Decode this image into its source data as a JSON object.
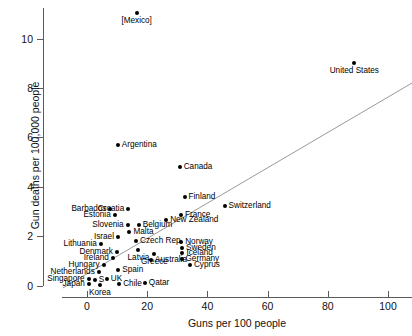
{
  "chart_data": {
    "type": "scatter",
    "title": "",
    "xlabel": "Guns per 100 people",
    "ylabel": "Gun deaths per 100,000 people",
    "xlim": [
      -12,
      108
    ],
    "ylim": [
      -0.55,
      11.6
    ],
    "xticks": [
      0,
      20,
      40,
      60,
      80,
      100
    ],
    "yticks": [
      0,
      2,
      4,
      6,
      8,
      10
    ],
    "grid": false,
    "legend": null,
    "trendline": {
      "x0": -8,
      "y0": -0.1,
      "x1": 108,
      "y1": 8.2,
      "color": "#999999"
    },
    "points": [
      {
        "label": "[Mexico]",
        "x": 16.5,
        "y": 11.05,
        "pos": "b"
      },
      {
        "label": "United States",
        "x": 88.8,
        "y": 9.0,
        "pos": "b"
      },
      {
        "label": "Argentina",
        "x": 10.2,
        "y": 5.7,
        "pos": "r"
      },
      {
        "label": "Canada",
        "x": 30.8,
        "y": 4.8,
        "pos": "r"
      },
      {
        "label": "Finland",
        "x": 32.4,
        "y": 3.6,
        "pos": "r"
      },
      {
        "label": "Switzerland",
        "x": 45.7,
        "y": 3.2,
        "pos": "r"
      },
      {
        "label": "Barbados",
        "x": 7.8,
        "y": 3.1,
        "pos": "l"
      },
      {
        "label": "Croatia",
        "x": 13.7,
        "y": 3.1,
        "pos": "l"
      },
      {
        "label": "France",
        "x": 31.2,
        "y": 2.85,
        "pos": "r"
      },
      {
        "label": "Estonia",
        "x": 9.2,
        "y": 2.85,
        "pos": "l"
      },
      {
        "label": "New Zealand",
        "x": 26.3,
        "y": 2.65,
        "pos": "r"
      },
      {
        "label": "Slovenia",
        "x": 13.5,
        "y": 2.45,
        "pos": "l"
      },
      {
        "label": "Belgium",
        "x": 17.2,
        "y": 2.45,
        "pos": "r"
      },
      {
        "label": "Malta",
        "x": 14.1,
        "y": 2.15,
        "pos": "r"
      },
      {
        "label": "Israel",
        "x": 10.3,
        "y": 1.98,
        "pos": "l"
      },
      {
        "label": "Czech Rep.",
        "x": 16.3,
        "y": 1.82,
        "pos": "r"
      },
      {
        "label": "Norway",
        "x": 31.3,
        "y": 1.78,
        "pos": "r"
      },
      {
        "label": "Lithuania",
        "x": 4.6,
        "y": 1.7,
        "pos": "l"
      },
      {
        "label": "Sweden",
        "x": 31.6,
        "y": 1.52,
        "pos": "r"
      },
      {
        "label": "Latvia",
        "x": 17.1,
        "y": 1.42,
        "pos": "b"
      },
      {
        "label": "Denmark",
        "x": 9.9,
        "y": 1.35,
        "pos": "l"
      },
      {
        "label": "Iceland",
        "x": 31.7,
        "y": 1.3,
        "pos": "r"
      },
      {
        "label": "Greece",
        "x": 22.4,
        "y": 1.28,
        "pos": "b"
      },
      {
        "label": "Ireland",
        "x": 8.6,
        "y": 1.1,
        "pos": "l"
      },
      {
        "label": "Germany",
        "x": 31.4,
        "y": 1.08,
        "pos": "r"
      },
      {
        "label": "Australia",
        "x": 21.3,
        "y": 1.02,
        "pos": "r"
      },
      {
        "label": "Hungary",
        "x": 5.5,
        "y": 0.85,
        "pos": "l"
      },
      {
        "label": "Cyprus",
        "x": 34.2,
        "y": 0.82,
        "pos": "r"
      },
      {
        "label": "Spain",
        "x": 10.4,
        "y": 0.62,
        "pos": "r"
      },
      {
        "label": "Netherlands",
        "x": 3.9,
        "y": 0.55,
        "pos": "l"
      },
      {
        "label": "UK",
        "x": 6.6,
        "y": 0.25,
        "pos": "r"
      },
      {
        "label": "Singapore",
        "x": 0.5,
        "y": 0.25,
        "pos": "l"
      },
      {
        "label": "S",
        "x": 2.6,
        "y": 0.22,
        "pos": "r"
      },
      {
        "label": "Chile",
        "x": 10.7,
        "y": 0.08,
        "pos": "r"
      },
      {
        "label": "Qatar",
        "x": 19.2,
        "y": 0.1,
        "pos": "r"
      },
      {
        "label": "Korea",
        "x": 4.3,
        "y": 0.02,
        "pos": "b"
      },
      {
        "label": "Japan",
        "x": 0.6,
        "y": 0.05,
        "pos": "l"
      }
    ]
  }
}
